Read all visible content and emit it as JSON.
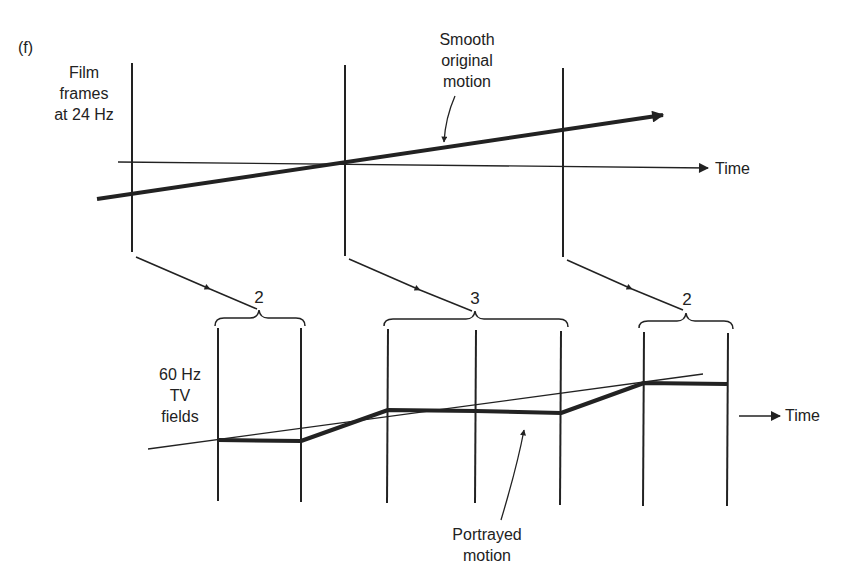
{
  "figure": {
    "panel_label": "(f)",
    "top": {
      "row_label": [
        "Film",
        "frames",
        "at 24 Hz"
      ],
      "annotation": [
        "Smooth",
        "original",
        "motion"
      ],
      "axis_label": "Time"
    },
    "mapping": {
      "counts": [
        "2",
        "3",
        "2"
      ]
    },
    "bottom": {
      "row_label": [
        "60 Hz",
        "TV",
        "fields"
      ],
      "annotation": [
        "Portrayed",
        "motion"
      ],
      "axis_label": "Time"
    }
  },
  "colors": {
    "ink": "#222222",
    "background": "#ffffff"
  }
}
